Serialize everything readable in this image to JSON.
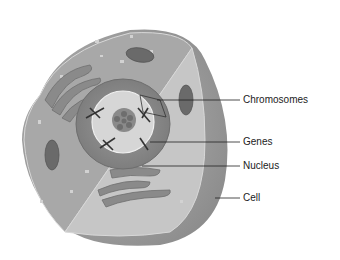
{
  "diagram": {
    "labels": [
      {
        "id": "chromosomes",
        "text": "Chromosomes"
      },
      {
        "id": "genes",
        "text": "Genes"
      },
      {
        "id": "nucleus",
        "text": "Nucleus"
      },
      {
        "id": "cell",
        "text": "Cell"
      }
    ]
  }
}
